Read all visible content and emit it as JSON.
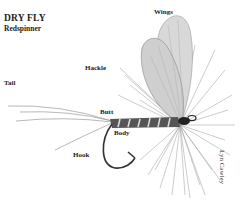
{
  "title": "DRY FLY",
  "subtitle": "Redspinner",
  "labels": {
    "wings": "Wings",
    "hackle": "Hackle",
    "tail": "Tail",
    "butt": "Butt",
    "body": "Body",
    "hook": "Hook"
  },
  "credit": "Lyn Cawley"
}
